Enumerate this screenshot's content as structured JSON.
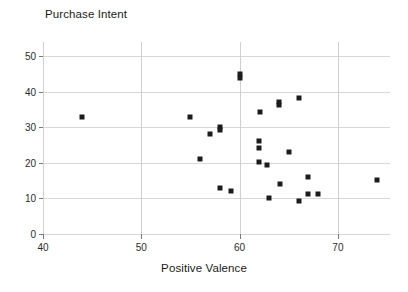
{
  "chart_data": {
    "type": "scatter",
    "title": "Purchase Intent",
    "xlabel": "Positive Valence",
    "ylabel": "",
    "xlim": [
      40,
      75.3
    ],
    "ylim": [
      0,
      54
    ],
    "xticks": [
      40,
      50,
      60,
      70
    ],
    "yticks": [
      0,
      10,
      20,
      30,
      40,
      50
    ],
    "grid": "horizontal gridlines at each y tick; vertical gridlines at each x tick",
    "legend": "none",
    "marker_style": "filled black square",
    "marker_color": "#1c1c1c",
    "points": [
      {
        "x": 44.0,
        "y": 33.0
      },
      {
        "x": 55.0,
        "y": 33.0
      },
      {
        "x": 56.0,
        "y": 21.2
      },
      {
        "x": 57.0,
        "y": 28.2
      },
      {
        "x": 58.0,
        "y": 30.0
      },
      {
        "x": 58.0,
        "y": 29.3
      },
      {
        "x": 58.0,
        "y": 13.0
      },
      {
        "x": 59.1,
        "y": 12.0
      },
      {
        "x": 60.0,
        "y": 45.0
      },
      {
        "x": 60.0,
        "y": 44.0
      },
      {
        "x": 62.0,
        "y": 26.2
      },
      {
        "x": 62.0,
        "y": 24.2
      },
      {
        "x": 62.0,
        "y": 20.2
      },
      {
        "x": 62.1,
        "y": 34.2
      },
      {
        "x": 62.8,
        "y": 19.3
      },
      {
        "x": 63.0,
        "y": 10.2
      },
      {
        "x": 64.0,
        "y": 37.0
      },
      {
        "x": 64.0,
        "y": 36.3
      },
      {
        "x": 64.1,
        "y": 14.0
      },
      {
        "x": 65.0,
        "y": 23.2
      },
      {
        "x": 66.0,
        "y": 38.2
      },
      {
        "x": 66.0,
        "y": 9.2
      },
      {
        "x": 67.0,
        "y": 16.1
      },
      {
        "x": 67.0,
        "y": 11.2
      },
      {
        "x": 68.0,
        "y": 11.2
      },
      {
        "x": 74.0,
        "y": 15.1
      }
    ]
  }
}
